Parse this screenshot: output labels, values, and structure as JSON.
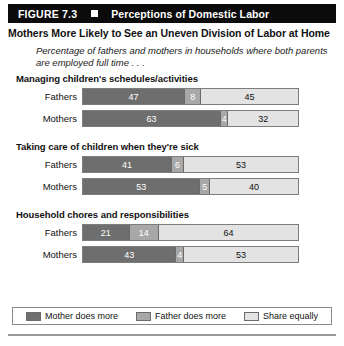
{
  "figure": {
    "number": "FIGURE 7.3",
    "title": "Perceptions of Domestic Labor",
    "headline": "Mothers More Likely to See an Uneven Division of Labor at Home",
    "subtitle": "Percentage of fathers and mothers in households where both parents are employed full time . . ."
  },
  "chart_data": {
    "type": "bar",
    "orientation": "horizontal",
    "stacked": true,
    "title": "Perceptions of Domestic Labor",
    "subtitle": "Percentage of fathers and mothers in households where both parents are employed full time . . .",
    "xlabel": "",
    "ylabel": "",
    "xlim": [
      0,
      100
    ],
    "unit": "percent",
    "grid": false,
    "legend_position": "bottom",
    "legend": [
      "Mother does more",
      "Father does more",
      "Share equally"
    ],
    "series_colors": [
      "#6e6e6e",
      "#a8a8a8",
      "#e3e3e3"
    ],
    "groups": [
      {
        "title": "Managing children's schedules/activities",
        "rows": [
          {
            "label": "Fathers",
            "values": [
              47,
              8,
              45
            ]
          },
          {
            "label": "Mothers",
            "values": [
              63,
              4,
              32
            ]
          }
        ]
      },
      {
        "title": "Taking care of children when they're sick",
        "rows": [
          {
            "label": "Fathers",
            "values": [
              41,
              6,
              53
            ]
          },
          {
            "label": "Mothers",
            "values": [
              53,
              5,
              40
            ]
          }
        ]
      },
      {
        "title": "Household chores and responsibilities",
        "rows": [
          {
            "label": "Fathers",
            "values": [
              21,
              14,
              64
            ]
          },
          {
            "label": "Mothers",
            "values": [
              43,
              4,
              53
            ]
          }
        ]
      }
    ]
  }
}
